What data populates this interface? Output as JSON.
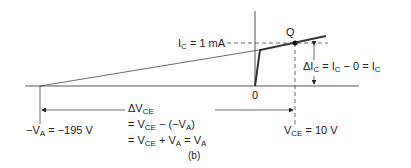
{
  "figure": {
    "caption": "(b)",
    "origin_label": "0",
    "q_point_label": "Q",
    "ic_label": {
      "main": "I",
      "sub": "C",
      "rest": " = 1 mA"
    },
    "delta_ic_label": {
      "p1": "ΔI",
      "s1": "C",
      "p2": " = I",
      "s2": "C",
      "p3": " − 0 = I",
      "s3": "C"
    },
    "va_label": {
      "p1": "−V",
      "s1": "A",
      "p2": " = −195 V"
    },
    "vce_label": {
      "p1": "V",
      "s1": "CE",
      "p2": " = 10 V"
    },
    "delta_vce": {
      "line1": {
        "p1": "ΔV",
        "s1": "CE"
      },
      "line2": {
        "p1": "= V",
        "s1": "CE",
        "p2": " − (−V",
        "s2": "A",
        "p3": ")"
      },
      "line3": {
        "p1": "= V",
        "s1": "CE",
        "p2": " + V",
        "s2": "A",
        "p3": " = V",
        "s3": "A"
      }
    },
    "colors": {
      "line": "#222222",
      "background": "#ffffff"
    }
  }
}
